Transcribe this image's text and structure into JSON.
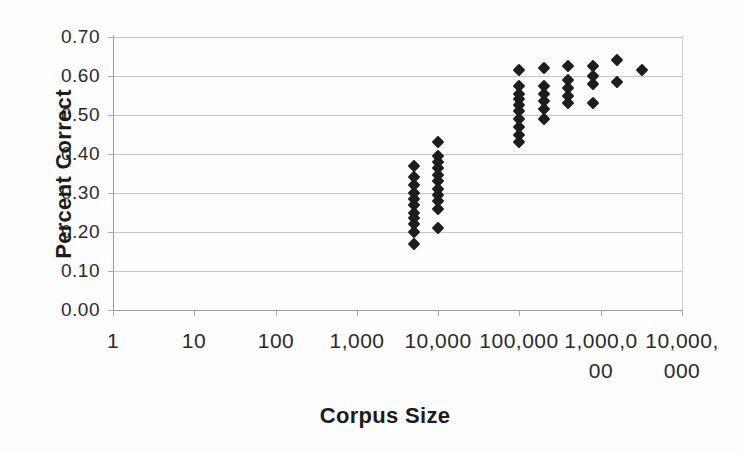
{
  "chart_data": {
    "type": "scatter",
    "title": "",
    "xlabel": "Corpus Size",
    "ylabel": "Percent Correct",
    "x_scale": "log10",
    "xlim": [
      1,
      10000000
    ],
    "ylim": [
      0.0,
      0.7
    ],
    "grid": "horizontal-only",
    "legend": "none",
    "marker": {
      "shape": "filled-diamond",
      "color": "#1d1d1d",
      "size_px": 12
    },
    "x_ticks": [
      {
        "value": 1,
        "label": "1"
      },
      {
        "value": 10,
        "label": "10"
      },
      {
        "value": 100,
        "label": "100"
      },
      {
        "value": 1000,
        "label": "1,000"
      },
      {
        "value": 10000,
        "label": "10,000"
      },
      {
        "value": 100000,
        "label": "100,000"
      },
      {
        "value": 1000000,
        "label": "1,000,0\n00"
      },
      {
        "value": 10000000,
        "label": "10,000,\n000"
      }
    ],
    "y_ticks": [
      {
        "value": 0.0,
        "label": "0.00"
      },
      {
        "value": 0.1,
        "label": "0.10"
      },
      {
        "value": 0.2,
        "label": "0.20"
      },
      {
        "value": 0.3,
        "label": "0.30"
      },
      {
        "value": 0.4,
        "label": "0.40"
      },
      {
        "value": 0.5,
        "label": "0.50"
      },
      {
        "value": 0.6,
        "label": "0.60"
      },
      {
        "value": 0.7,
        "label": "0.70"
      }
    ],
    "series": [
      {
        "name": "percent-correct-vs-corpus-size",
        "groups": [
          {
            "x": 5000,
            "y": [
              0.37,
              0.34,
              0.32,
              0.3,
              0.285,
              0.27,
              0.25,
              0.235,
              0.22,
              0.2,
              0.17
            ]
          },
          {
            "x": 10000,
            "y": [
              0.43,
              0.395,
              0.38,
              0.365,
              0.345,
              0.33,
              0.31,
              0.295,
              0.28,
              0.26,
              0.21
            ]
          },
          {
            "x": 100000,
            "y": [
              0.615,
              0.575,
              0.555,
              0.54,
              0.525,
              0.51,
              0.49,
              0.47,
              0.45,
              0.43
            ]
          },
          {
            "x": 200000,
            "y": [
              0.62,
              0.575,
              0.555,
              0.535,
              0.515,
              0.49
            ]
          },
          {
            "x": 400000,
            "y": [
              0.625,
              0.59,
              0.57,
              0.55,
              0.53
            ]
          },
          {
            "x": 800000,
            "y": [
              0.625,
              0.6,
              0.58,
              0.53
            ]
          },
          {
            "x": 1600000,
            "y": [
              0.64,
              0.585
            ]
          },
          {
            "x": 3200000,
            "y": [
              0.615
            ]
          }
        ]
      }
    ]
  },
  "colors": {
    "background": "#fdfdfd",
    "axis": "#9b9b9b",
    "gridline": "#c6c6c6",
    "text": "#2a2a2a",
    "marker": "#1d1d1d"
  }
}
